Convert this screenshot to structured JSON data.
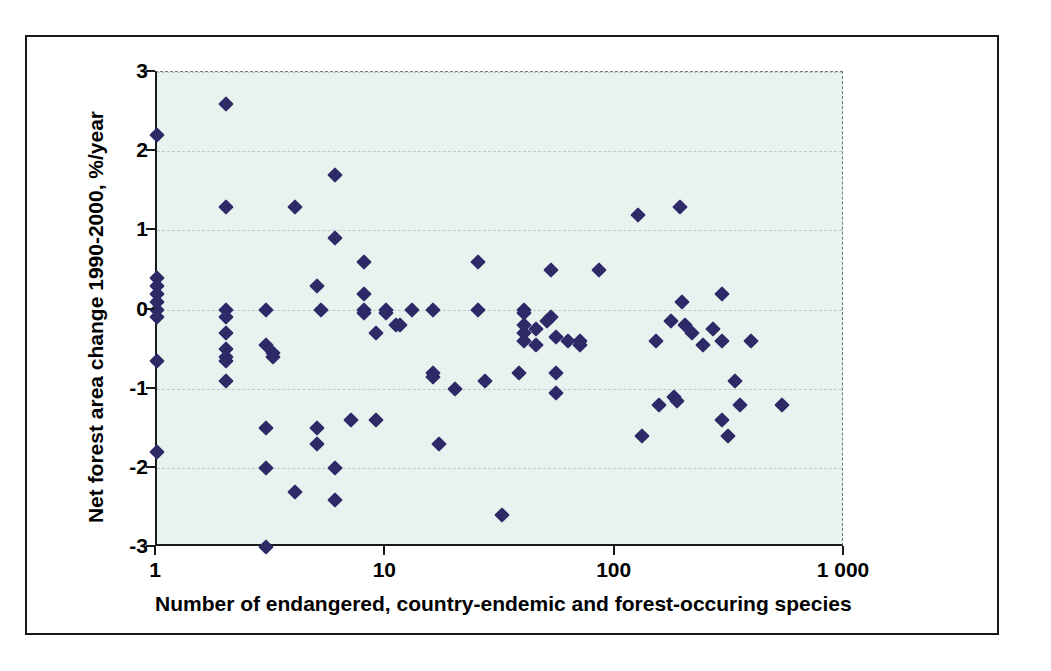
{
  "chart_data": {
    "type": "scatter",
    "title": "",
    "xlabel": "Number of endangered, country-endemic and forest-occuring species",
    "ylabel": "Net forest area change 1990-2000, %/year",
    "xscale": "log",
    "yscale": "linear",
    "xlim": [
      1,
      1000
    ],
    "ylim": [
      -3,
      3
    ],
    "xticks": [
      1,
      10,
      100,
      1000
    ],
    "xticklabels": [
      "1",
      "10",
      "100",
      "1 000"
    ],
    "yticks": [
      -3,
      -2,
      -1,
      0,
      1,
      2,
      3
    ],
    "yticklabels": [
      "-3",
      "-2",
      "-1",
      "0",
      "1",
      "2",
      "3"
    ],
    "grid": "horizontal-dashed",
    "legend": "none",
    "marker": "diamond",
    "marker_color": "#2e2a68",
    "plot_background": "#e8f2ef",
    "series": [
      {
        "name": "countries",
        "points": [
          [
            1,
            2.2
          ],
          [
            1,
            0.4
          ],
          [
            1,
            0.3
          ],
          [
            1,
            0.2
          ],
          [
            1,
            0.1
          ],
          [
            1,
            0.0
          ],
          [
            1,
            -0.1
          ],
          [
            1,
            -0.65
          ],
          [
            1,
            -1.8
          ],
          [
            2,
            2.6
          ],
          [
            2,
            1.3
          ],
          [
            2,
            0.0
          ],
          [
            2,
            -0.1
          ],
          [
            2,
            -0.3
          ],
          [
            2,
            -0.5
          ],
          [
            2,
            -0.6
          ],
          [
            2,
            -0.65
          ],
          [
            2,
            -0.9
          ],
          [
            3,
            0.0
          ],
          [
            3,
            -0.45
          ],
          [
            3,
            -1.5
          ],
          [
            3,
            -2.0
          ],
          [
            3,
            -3.0
          ],
          [
            3.2,
            -0.55
          ],
          [
            3.2,
            -0.6
          ],
          [
            4,
            1.3
          ],
          [
            4,
            -2.3
          ],
          [
            5,
            0.3
          ],
          [
            5,
            -1.5
          ],
          [
            5,
            -1.7
          ],
          [
            5.2,
            0.0
          ],
          [
            6,
            1.7
          ],
          [
            6,
            0.9
          ],
          [
            6,
            -2.0
          ],
          [
            6,
            -2.4
          ],
          [
            7,
            -1.4
          ],
          [
            8,
            0.6
          ],
          [
            8,
            0.2
          ],
          [
            8,
            0.0
          ],
          [
            8,
            -0.05
          ],
          [
            9,
            -0.3
          ],
          [
            9,
            -1.4
          ],
          [
            10,
            0.0
          ],
          [
            10,
            -0.05
          ],
          [
            11,
            -0.2
          ],
          [
            11.5,
            -0.2
          ],
          [
            13,
            0.0
          ],
          [
            16,
            0.0
          ],
          [
            16,
            -0.8
          ],
          [
            16,
            -0.85
          ],
          [
            17,
            -1.7
          ],
          [
            20,
            -1.0
          ],
          [
            25,
            0.6
          ],
          [
            25,
            0.0
          ],
          [
            27,
            -0.9
          ],
          [
            32,
            -2.6
          ],
          [
            38,
            -0.8
          ],
          [
            40,
            0.0
          ],
          [
            40,
            -0.05
          ],
          [
            40,
            -0.2
          ],
          [
            40,
            -0.3
          ],
          [
            40,
            -0.4
          ],
          [
            45,
            -0.25
          ],
          [
            45,
            -0.45
          ],
          [
            50,
            -0.15
          ],
          [
            52,
            0.5
          ],
          [
            52,
            -0.1
          ],
          [
            55,
            -0.35
          ],
          [
            55,
            -0.8
          ],
          [
            55,
            -1.05
          ],
          [
            62,
            -0.4
          ],
          [
            70,
            -0.45
          ],
          [
            70,
            -0.4
          ],
          [
            85,
            0.5
          ],
          [
            125,
            1.2
          ],
          [
            130,
            -1.6
          ],
          [
            150,
            -0.4
          ],
          [
            155,
            -1.2
          ],
          [
            175,
            -0.15
          ],
          [
            180,
            -1.1
          ],
          [
            185,
            -1.15
          ],
          [
            190,
            1.3
          ],
          [
            195,
            0.1
          ],
          [
            200,
            -0.2
          ],
          [
            215,
            -0.3
          ],
          [
            240,
            -0.45
          ],
          [
            265,
            -0.25
          ],
          [
            290,
            0.2
          ],
          [
            290,
            -0.4
          ],
          [
            290,
            -1.4
          ],
          [
            310,
            -1.6
          ],
          [
            330,
            -0.9
          ],
          [
            350,
            -1.2
          ],
          [
            390,
            -0.4
          ],
          [
            530,
            -1.2
          ]
        ]
      }
    ]
  },
  "axis": {
    "x_title": "Number of endangered, country-endemic and forest-occuring species",
    "y_title": "Net forest area change 1990-2000, %/year"
  }
}
